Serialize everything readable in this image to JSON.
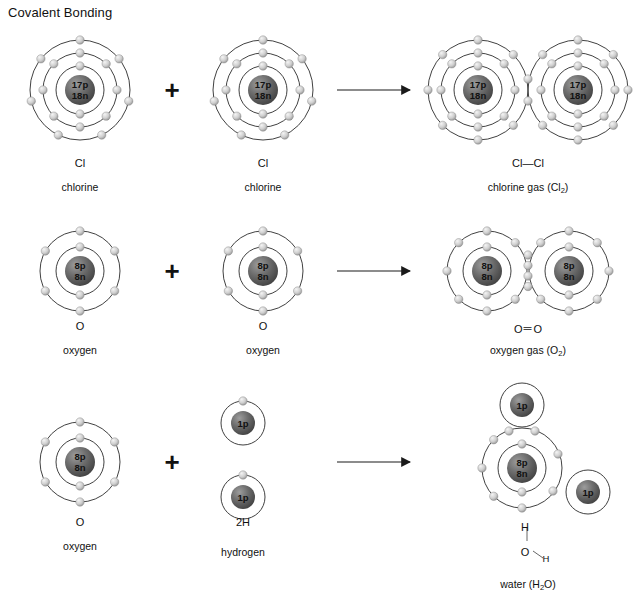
{
  "title": "Covalent Bonding",
  "operators": {
    "plus": "+",
    "arrow": "arrow-right"
  },
  "reactions": [
    {
      "id": "chlorine",
      "reactants": [
        {
          "symbol": "Cl",
          "name": "chlorine",
          "nucleus": [
            "17p",
            "18n"
          ],
          "shells": [
            2,
            8,
            7
          ]
        },
        {
          "symbol": "Cl",
          "name": "chlorine",
          "nucleus": [
            "17p",
            "18n"
          ],
          "shells": [
            2,
            8,
            7
          ]
        }
      ],
      "product": {
        "formula": "Cl—Cl",
        "name": "chlorine gas (Cl₂)",
        "name_base": "chlorine gas (Cl",
        "name_sub": "2",
        "name_tail": ")",
        "bond": "single",
        "shared_electrons": 2,
        "nucleus": [
          "17p",
          "18n"
        ],
        "shells": [
          2,
          8,
          7
        ]
      }
    },
    {
      "id": "oxygen",
      "reactants": [
        {
          "symbol": "O",
          "name": "oxygen",
          "nucleus": [
            "8p",
            "8n"
          ],
          "shells": [
            2,
            6
          ]
        },
        {
          "symbol": "O",
          "name": "oxygen",
          "nucleus": [
            "8p",
            "8n"
          ],
          "shells": [
            2,
            6
          ]
        }
      ],
      "product": {
        "formula": "O＝O",
        "name": "oxygen gas (O₂)",
        "name_base": "oxygen gas (O",
        "name_sub": "2",
        "name_tail": ")",
        "bond": "double",
        "shared_electrons": 4,
        "nucleus": [
          "8p",
          "8n"
        ],
        "shells": [
          2,
          6
        ]
      }
    },
    {
      "id": "water",
      "reactants": [
        {
          "symbol": "O",
          "name": "oxygen",
          "nucleus": [
            "8p",
            "8n"
          ],
          "shells": [
            2,
            6
          ]
        },
        {
          "symbol": "2H",
          "name": "hydrogen",
          "nucleus": [
            "1p"
          ],
          "shells": [
            1
          ],
          "count": 2
        }
      ],
      "product": {
        "formula_atoms": [
          "H",
          "O",
          "H"
        ],
        "name": "water (H₂O)",
        "name_base": "water (H",
        "name_sub": "2",
        "name_tail": "O)",
        "bond": "two-single",
        "shared_electrons": 4,
        "nucleus": [
          "8p",
          "8n"
        ],
        "shells": [
          2,
          6
        ],
        "hydrogen_nucleus": [
          "1p"
        ]
      }
    }
  ],
  "colors": {
    "nucleus_dark": "#4a4a4a",
    "nucleus_light": "#9a9a9a",
    "electron_light": "#e8e8e8",
    "electron_dark": "#9d9d9d",
    "shell_stroke": "#2b2b2b",
    "text": "#111111"
  }
}
